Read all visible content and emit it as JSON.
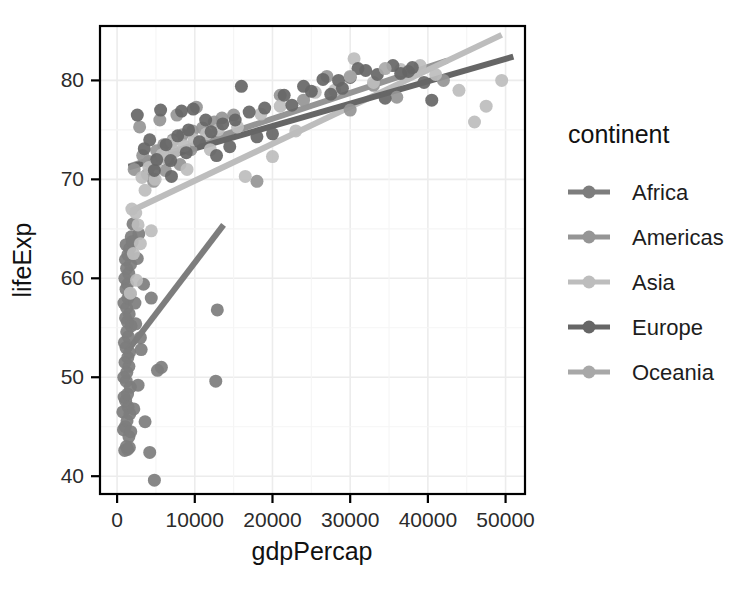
{
  "chart_data": {
    "type": "scatter",
    "title": "",
    "xlabel": "gdpPercap",
    "ylabel": "lifeExp",
    "xlim": [
      -2200,
      52500
    ],
    "ylim": [
      38.2,
      85.5
    ],
    "xticks": [
      0,
      10000,
      20000,
      30000,
      40000,
      50000
    ],
    "xticklabels": [
      "0",
      "10000",
      "20000",
      "30000",
      "40000",
      "50000"
    ],
    "yticks": [
      40,
      50,
      60,
      70,
      80
    ],
    "yticklabels": [
      "40",
      "50",
      "60",
      "70",
      "80"
    ],
    "grid": true,
    "legend": {
      "title": "continent",
      "position": "right",
      "entries": [
        {
          "label": "Africa",
          "color": "#7d7d7d"
        },
        {
          "label": "Americas",
          "color": "#959595"
        },
        {
          "label": "Asia",
          "color": "#bdbdbd"
        },
        {
          "label": "Europe",
          "color": "#666666"
        },
        {
          "label": "Oceania",
          "color": "#a8a8a8"
        }
      ]
    },
    "series": [
      {
        "name": "Africa",
        "color": "#7d7d7d",
        "trendline": {
          "x": [
            1300,
            13700
          ],
          "y": [
            52.6,
            65.4
          ]
        },
        "points": [
          [
            1200,
            43.0
          ],
          [
            1350,
            42.7
          ],
          [
            980,
            42.6
          ],
          [
            1520,
            44.0
          ],
          [
            820,
            44.7
          ],
          [
            1060,
            45.0
          ],
          [
            1280,
            45.6
          ],
          [
            1640,
            46.3
          ],
          [
            740,
            46.5
          ],
          [
            1420,
            47.0
          ],
          [
            1100,
            47.6
          ],
          [
            900,
            48.0
          ],
          [
            1350,
            48.3
          ],
          [
            1700,
            49.0
          ],
          [
            1180,
            49.6
          ],
          [
            860,
            50.0
          ],
          [
            1250,
            50.5
          ],
          [
            1520,
            51.1
          ],
          [
            1020,
            51.5
          ],
          [
            1380,
            52.0
          ],
          [
            1600,
            52.5
          ],
          [
            1150,
            53.0
          ],
          [
            940,
            53.5
          ],
          [
            1450,
            54.1
          ],
          [
            1240,
            54.6
          ],
          [
            1800,
            55.2
          ],
          [
            1320,
            55.6
          ],
          [
            1090,
            56.0
          ],
          [
            1560,
            56.4
          ],
          [
            1230,
            57.0
          ],
          [
            880,
            57.5
          ],
          [
            1410,
            58.0
          ],
          [
            1670,
            58.4
          ],
          [
            1150,
            58.9
          ],
          [
            1340,
            59.4
          ],
          [
            1000,
            60.0
          ],
          [
            1500,
            60.5
          ],
          [
            1220,
            61.0
          ],
          [
            1730,
            61.4
          ],
          [
            1080,
            61.9
          ],
          [
            1390,
            62.4
          ],
          [
            1610,
            63.0
          ],
          [
            1160,
            63.4
          ],
          [
            2400,
            55.4
          ],
          [
            3100,
            52.8
          ],
          [
            4800,
            39.6
          ],
          [
            4200,
            42.4
          ],
          [
            5200,
            50.7
          ],
          [
            5700,
            51.0
          ],
          [
            12700,
            49.6
          ],
          [
            12900,
            56.8
          ],
          [
            4400,
            58.0
          ],
          [
            2800,
            64.5
          ],
          [
            3400,
            59.4
          ],
          [
            2050,
            65.5
          ],
          [
            1820,
            64.2
          ],
          [
            2600,
            62.0
          ],
          [
            1950,
            63.7
          ],
          [
            2300,
            57.5
          ],
          [
            3000,
            54.0
          ],
          [
            1760,
            44.5
          ],
          [
            2150,
            46.8
          ],
          [
            2700,
            49.2
          ],
          [
            3600,
            45.5
          ],
          [
            1580,
            42.9
          ]
        ]
      },
      {
        "name": "Americas",
        "color": "#959595",
        "trendline": {
          "x": [
            1500,
            42500
          ],
          "y": [
            71.3,
            82.0
          ]
        },
        "points": [
          [
            2200,
            71.0
          ],
          [
            3300,
            72.4
          ],
          [
            4100,
            71.8
          ],
          [
            5100,
            72.9
          ],
          [
            6000,
            73.5
          ],
          [
            7200,
            74.0
          ],
          [
            8400,
            74.5
          ],
          [
            9700,
            74.9
          ],
          [
            11000,
            75.2
          ],
          [
            12500,
            75.8
          ],
          [
            3900,
            70.5
          ],
          [
            4700,
            69.8
          ],
          [
            6600,
            72.0
          ],
          [
            8100,
            71.5
          ],
          [
            9500,
            73.0
          ],
          [
            13500,
            76.2
          ],
          [
            15000,
            76.5
          ],
          [
            18000,
            69.8
          ],
          [
            21000,
            78.5
          ],
          [
            24000,
            78.0
          ],
          [
            2900,
            75.3
          ],
          [
            5500,
            76.0
          ],
          [
            10200,
            77.3
          ],
          [
            27000,
            80.4
          ],
          [
            36000,
            78.3
          ],
          [
            30000,
            77.0
          ],
          [
            33000,
            79.5
          ],
          [
            42000,
            80.0
          ],
          [
            7700,
            76.5
          ],
          [
            6200,
            70.9
          ]
        ]
      },
      {
        "name": "Asia",
        "color": "#bdbdbd",
        "trendline": {
          "x": [
            1800,
            49500
          ],
          "y": [
            66.8,
            84.6
          ]
        },
        "points": [
          [
            2400,
            66.6
          ],
          [
            1900,
            67.0
          ],
          [
            3200,
            70.2
          ],
          [
            4100,
            71.2
          ],
          [
            5000,
            71.6
          ],
          [
            6200,
            72.2
          ],
          [
            7400,
            72.8
          ],
          [
            8600,
            73.4
          ],
          [
            9900,
            74.0
          ],
          [
            11500,
            74.6
          ],
          [
            13000,
            75.0
          ],
          [
            2700,
            65.4
          ],
          [
            3600,
            68.9
          ],
          [
            4900,
            70.0
          ],
          [
            5800,
            72.5
          ],
          [
            7100,
            73.8
          ],
          [
            15500,
            75.3
          ],
          [
            18500,
            76.6
          ],
          [
            21000,
            77.4
          ],
          [
            25500,
            78.8
          ],
          [
            28000,
            79.0
          ],
          [
            30500,
            82.2
          ],
          [
            33000,
            79.8
          ],
          [
            36500,
            81.1
          ],
          [
            39000,
            81.5
          ],
          [
            44000,
            79.0
          ],
          [
            47500,
            77.4
          ],
          [
            49500,
            80.0
          ],
          [
            12000,
            73.0
          ],
          [
            9000,
            71.0
          ],
          [
            2100,
            62.5
          ],
          [
            2500,
            59.8
          ],
          [
            1700,
            58.5
          ],
          [
            3000,
            63.5
          ],
          [
            4400,
            64.8
          ],
          [
            20000,
            72.3
          ],
          [
            23000,
            74.9
          ],
          [
            16500,
            70.3
          ],
          [
            41000,
            80.6
          ],
          [
            46000,
            75.8
          ]
        ]
      },
      {
        "name": "Europe",
        "color": "#666666",
        "trendline": {
          "x": [
            1500,
            51000
          ],
          "y": [
            71.2,
            82.4
          ]
        },
        "points": [
          [
            4200,
            74.0
          ],
          [
            6300,
            73.5
          ],
          [
            7800,
            74.4
          ],
          [
            9200,
            75.0
          ],
          [
            10600,
            73.8
          ],
          [
            12100,
            74.8
          ],
          [
            13600,
            75.6
          ],
          [
            15200,
            76.0
          ],
          [
            17000,
            76.8
          ],
          [
            19000,
            77.2
          ],
          [
            5100,
            72.0
          ],
          [
            6900,
            71.9
          ],
          [
            8300,
            76.9
          ],
          [
            9800,
            77.1
          ],
          [
            11400,
            76.0
          ],
          [
            21500,
            78.5
          ],
          [
            24000,
            79.4
          ],
          [
            26500,
            80.1
          ],
          [
            29000,
            79.2
          ],
          [
            31000,
            81.2
          ],
          [
            33500,
            80.6
          ],
          [
            35500,
            81.5
          ],
          [
            37500,
            80.9
          ],
          [
            39500,
            79.8
          ],
          [
            3500,
            73.1
          ],
          [
            4800,
            70.9
          ],
          [
            7000,
            70.3
          ],
          [
            22500,
            77.5
          ],
          [
            28500,
            80.0
          ],
          [
            32000,
            81.0
          ],
          [
            34500,
            78.2
          ],
          [
            38000,
            81.3
          ],
          [
            8900,
            72.7
          ],
          [
            14500,
            73.3
          ],
          [
            18000,
            74.3
          ],
          [
            25000,
            78.9
          ],
          [
            30000,
            80.3
          ],
          [
            36500,
            80.7
          ],
          [
            40500,
            78.0
          ],
          [
            12800,
            72.4
          ],
          [
            2600,
            76.5
          ],
          [
            5600,
            77.0
          ],
          [
            16000,
            79.4
          ],
          [
            20000,
            74.6
          ],
          [
            27500,
            78.6
          ]
        ]
      },
      {
        "name": "Oceania",
        "color": "#a8a8a8",
        "trendline": null,
        "points": [
          [
            30000,
            80.4
          ],
          [
            34500,
            81.2
          ]
        ]
      }
    ]
  }
}
